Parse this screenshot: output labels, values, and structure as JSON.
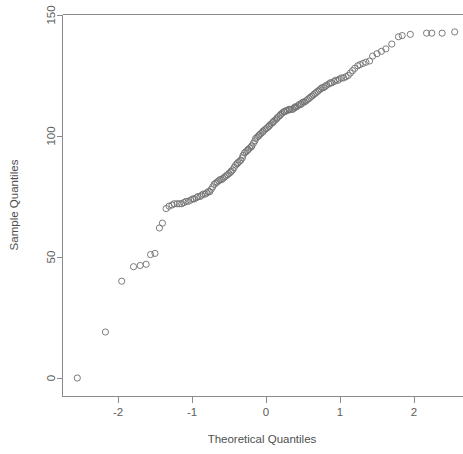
{
  "chart_data": {
    "type": "scatter",
    "title": "",
    "subtitle": "",
    "xlabel": "Theoretical Quantiles",
    "ylabel": "Sample Quantiles",
    "xlim": [
      -2.72,
      2.72
    ],
    "ylim": [
      -6,
      150
    ],
    "xticks": [
      -2,
      -1,
      0,
      1,
      2
    ],
    "xtick_labels": [
      "-2",
      "-1",
      "0",
      "1",
      "2"
    ],
    "yticks": [
      0,
      50,
      100,
      150
    ],
    "ytick_labels": [
      "0",
      "50",
      "100",
      "150"
    ],
    "grid": false,
    "legend": null,
    "marker": "open-circle",
    "marker_color": "#6e6e6e",
    "axis_color": "#8a8a8a",
    "background": "#ffffff",
    "point_count": 150,
    "series": [
      {
        "name": "sample quantiles",
        "x": [
          -2.55,
          -2.17,
          -1.95,
          -1.79,
          -1.7,
          -1.62,
          -1.56,
          -1.5,
          -1.44,
          -1.4,
          -1.35,
          -1.31,
          -1.27,
          -1.24,
          -1.2,
          -1.17,
          -1.14,
          -1.11,
          -1.08,
          -1.05,
          -1.02,
          -0.99,
          -0.97,
          -0.94,
          -0.92,
          -0.89,
          -0.87,
          -0.85,
          -0.82,
          -0.8,
          -0.78,
          -0.76,
          -0.74,
          -0.72,
          -0.7,
          -0.68,
          -0.66,
          -0.64,
          -0.62,
          -0.6,
          -0.58,
          -0.56,
          -0.54,
          -0.52,
          -0.5,
          -0.48,
          -0.47,
          -0.45,
          -0.43,
          -0.41,
          -0.39,
          -0.38,
          -0.36,
          -0.34,
          -0.32,
          -0.31,
          -0.29,
          -0.27,
          -0.25,
          -0.24,
          -0.22,
          -0.2,
          -0.19,
          -0.17,
          -0.15,
          -0.14,
          -0.12,
          -0.1,
          -0.09,
          -0.07,
          -0.05,
          -0.04,
          -0.02,
          0.0,
          0.02,
          0.04,
          0.05,
          0.07,
          0.09,
          0.1,
          0.12,
          0.14,
          0.15,
          0.17,
          0.19,
          0.2,
          0.22,
          0.24,
          0.25,
          0.27,
          0.29,
          0.31,
          0.32,
          0.34,
          0.36,
          0.38,
          0.39,
          0.41,
          0.43,
          0.45,
          0.47,
          0.48,
          0.5,
          0.52,
          0.54,
          0.56,
          0.58,
          0.6,
          0.62,
          0.64,
          0.66,
          0.68,
          0.7,
          0.72,
          0.74,
          0.76,
          0.78,
          0.8,
          0.82,
          0.85,
          0.87,
          0.89,
          0.92,
          0.94,
          0.97,
          0.99,
          1.02,
          1.05,
          1.08,
          1.11,
          1.14,
          1.17,
          1.2,
          1.24,
          1.27,
          1.31,
          1.35,
          1.4,
          1.44,
          1.5,
          1.56,
          1.62,
          1.7,
          1.79,
          1.84,
          1.95,
          2.17,
          2.24,
          2.38,
          2.55
        ],
        "y": [
          0,
          19,
          40,
          46,
          46.5,
          47,
          51,
          51.5,
          62,
          64,
          70,
          71,
          71.5,
          72,
          72,
          72,
          72,
          72.5,
          73,
          73,
          73.5,
          74,
          74,
          74.5,
          75,
          75,
          75.5,
          76,
          76,
          76.5,
          77,
          77,
          78,
          79,
          80,
          80.5,
          81,
          81.5,
          82,
          82,
          82.5,
          83,
          83.5,
          84,
          84.5,
          85,
          85.5,
          86,
          87,
          88,
          88.5,
          89,
          89.5,
          90,
          91,
          92,
          93,
          93.5,
          94,
          94.5,
          95,
          95.5,
          96,
          97,
          98,
          99,
          99.5,
          100,
          100.5,
          101,
          101.5,
          102,
          102.5,
          103,
          103.5,
          104,
          104.5,
          105,
          105.5,
          106,
          106.5,
          107,
          107.5,
          108,
          108.5,
          109,
          109.5,
          110,
          110,
          110.5,
          110.5,
          111,
          111,
          111,
          111,
          111.5,
          112,
          112,
          112.5,
          113,
          113,
          113.5,
          114,
          114,
          114.5,
          115,
          115.5,
          116,
          116.5,
          117,
          117.5,
          118,
          118.5,
          119,
          119.5,
          120,
          120,
          120.5,
          121,
          121.5,
          122,
          122,
          122.5,
          123,
          123,
          123.5,
          124,
          124,
          124.5,
          125,
          126,
          127,
          128,
          129,
          129.5,
          130,
          130.5,
          131,
          133,
          134,
          135,
          136,
          138,
          141,
          141.5,
          142,
          142.5,
          142.5,
          142.5,
          143
        ]
      }
    ]
  },
  "axes": {
    "x_axis_name": "theoretical-quantiles-axis",
    "y_axis_name": "sample-quantiles-axis"
  }
}
